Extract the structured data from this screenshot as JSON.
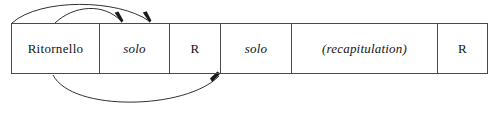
{
  "diagram": {
    "colors": {
      "background": "#ffffff",
      "box_stroke": "#4a4a4a",
      "arc_stroke": "#1a1a1a",
      "text": "#141414"
    },
    "table": {
      "cells": [
        {
          "label": "Ritornello",
          "style": "upright",
          "width": 88
        },
        {
          "label": "solo",
          "style": "italic",
          "width": 70
        },
        {
          "label": "R",
          "style": "upright",
          "width": 51
        },
        {
          "label": "solo",
          "style": "italic",
          "width": 71
        },
        {
          "label": "(recapitulation)",
          "style": "italic",
          "width": 146
        },
        {
          "label": "R",
          "style": "upright",
          "width": 51
        }
      ]
    },
    "arcs": [
      {
        "name": "upper-arc-long",
        "position": "above",
        "from_cell": "Ritornello",
        "to_cell": "solo",
        "arrowhead": "end"
      },
      {
        "name": "upper-arc-short",
        "position": "above",
        "from_cell": "Ritornello",
        "to_cell": "solo",
        "arrowhead": "end"
      },
      {
        "name": "lower-arc",
        "position": "below",
        "from_cell": "Ritornello",
        "to_cell": "solo",
        "arrowhead": "end"
      }
    ]
  }
}
